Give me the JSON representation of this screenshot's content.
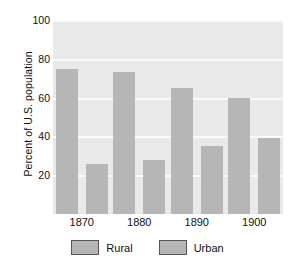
{
  "chart_data": {
    "type": "bar",
    "title": "",
    "subtitle": "",
    "xlabel": "",
    "ylabel": "Percent of U.S. population",
    "categories": [
      "1870",
      "1880",
      "1890",
      "1900"
    ],
    "series": [
      {
        "name": "Rural",
        "values": [
          75,
          73,
          65,
          60
        ],
        "color": "#b6b6b6"
      },
      {
        "name": "Urban",
        "values": [
          26,
          28,
          35,
          39
        ],
        "color": "#b6b6b6"
      }
    ],
    "ylim": [
      0,
      100
    ],
    "yticks": [
      20,
      40,
      60,
      80,
      100
    ],
    "ytick_labels": [
      "20",
      "40",
      "60",
      "80",
      "100"
    ],
    "grid": true,
    "grid_color": "#fbfbfb",
    "plot_background": "#e9e9e9",
    "legend_position": "bottom-center",
    "legend_entries": [
      "Rural",
      "Urban"
    ]
  }
}
